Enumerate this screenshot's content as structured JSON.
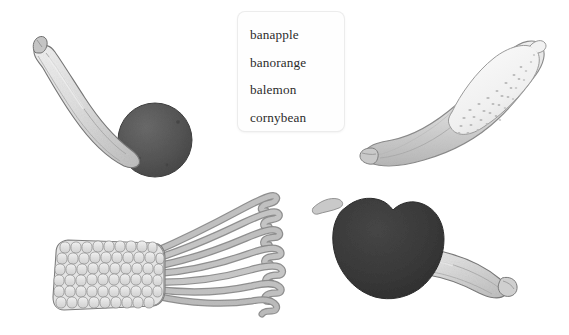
{
  "page": {
    "background_color": "#ffffff",
    "width": 569,
    "height": 335
  },
  "label_card": {
    "name": "fruit-name-list",
    "background_color": "#fefefe",
    "border_color": "#ececec",
    "text_color": "#2b2b2b",
    "items": [
      {
        "label": "banapple"
      },
      {
        "label": "banorange"
      },
      {
        "label": "balemon"
      },
      {
        "label": "cornybean"
      }
    ]
  },
  "illustrations": [
    {
      "name": "banorange",
      "description": "banana fused with a round orange",
      "position": "top-left",
      "parts": [
        "banana-body",
        "banana-stem",
        "orange-sphere"
      ],
      "colors": {
        "banana": "#dcdcdc",
        "banana_shadow": "#b8b8b8",
        "orange": "#575757",
        "outline": "#6e6e6e"
      }
    },
    {
      "name": "balemon",
      "description": "banana fused with a dotted lemon",
      "position": "top-right",
      "parts": [
        "banana-body",
        "banana-tip",
        "lemon-bulb",
        "lemon-pits"
      ],
      "colors": {
        "banana": "#e2e2e2",
        "lemon": "#f4f4f4",
        "outline": "#8a8a8a"
      }
    },
    {
      "name": "cornybean",
      "description": "corn cob ending in green bean pods",
      "position": "bottom-left",
      "parts": [
        "corn-cob",
        "corn-kernels",
        "bean-pods"
      ],
      "kernel_rows": 6,
      "bean_count": 7,
      "colors": {
        "kernel": "#e6e6e6",
        "bean": "#b4b4b4",
        "outline": "#7b7b7b"
      }
    },
    {
      "name": "banapple",
      "description": "dark apple fused with a banana",
      "position": "bottom-right",
      "parts": [
        "apple-body",
        "apple-stem",
        "banana-body",
        "banana-tip"
      ],
      "colors": {
        "apple": "#3a3a3a",
        "banana": "#dedede",
        "outline": "#767676"
      }
    }
  ]
}
